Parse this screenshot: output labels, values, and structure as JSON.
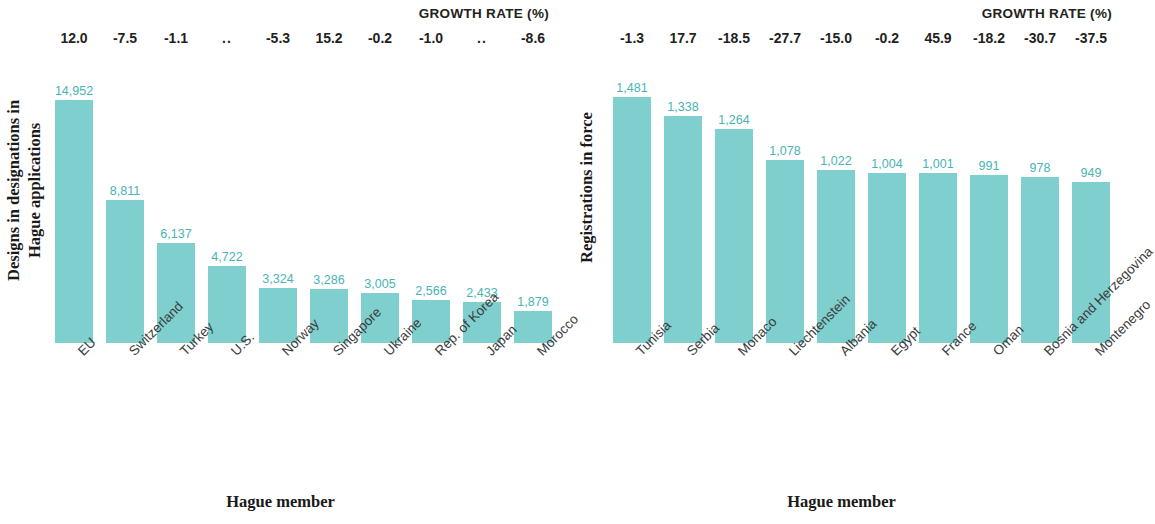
{
  "theme": {
    "bar_color": "#7ecfcd",
    "value_label_color": "#49b3b4",
    "text_color": "#231f20"
  },
  "panels": {
    "left": {
      "growth_header": "GROWTH RATE (%)",
      "y_title": "Designs in designations in\nHague applications",
      "x_title": "Hague member"
    },
    "right": {
      "growth_header": "GROWTH RATE (%)",
      "y_title": "Registrations in force",
      "x_title": "Hague member"
    }
  },
  "chart_data": [
    {
      "type": "bar",
      "title": "Designs in designations in Hague applications",
      "xlabel": "Hague member",
      "ylabel": "Designs in designations in Hague applications",
      "categories": [
        "EU",
        "Switzerland",
        "Turkey",
        "U.S.",
        "Norway",
        "Singapore",
        "Ukraine",
        "Rep. of Korea",
        "Japan",
        "Morocco"
      ],
      "values": [
        14952,
        8811,
        6137,
        4722,
        3324,
        3286,
        3005,
        2566,
        2433,
        1879
      ],
      "value_labels": [
        "14,952",
        "8,811",
        "6,137",
        "4,722",
        "3,324",
        "3,286",
        "3,005",
        "2,566",
        "2,433",
        "1,879"
      ],
      "growth_rate_label": "GROWTH RATE (%)",
      "growth_rates": [
        "12.0",
        "-7.5",
        "-1.1",
        "..",
        "-5.3",
        "15.2",
        "-0.2",
        "-1.0",
        "..",
        "-8.6"
      ],
      "bar_pixel_heights": [
        243,
        143,
        100,
        77,
        55,
        54,
        50,
        43,
        41,
        32
      ],
      "grid": false,
      "legend": false
    },
    {
      "type": "bar",
      "title": "Registrations in force",
      "xlabel": "Hague member",
      "ylabel": "Registrations in force",
      "categories": [
        "Tunisia",
        "Serbia",
        "Monaco",
        "Liechtenstein",
        "Albania",
        "Egypt",
        "France",
        "Oman",
        "Bosnia and Herzegovina",
        "Montenegro"
      ],
      "values": [
        1481,
        1338,
        1264,
        1078,
        1022,
        1004,
        1001,
        991,
        978,
        949
      ],
      "value_labels": [
        "1,481",
        "1,338",
        "1,264",
        "1,078",
        "1,022",
        "1,004",
        "1,001",
        "991",
        "978",
        "949"
      ],
      "growth_rate_label": "GROWTH RATE (%)",
      "growth_rates": [
        "-1.3",
        "17.7",
        "-18.5",
        "-27.7",
        "-15.0",
        "-0.2",
        "45.9",
        "-18.2",
        "-30.7",
        "-37.5"
      ],
      "bar_pixel_heights": [
        246,
        227,
        214,
        183,
        173,
        170,
        170,
        168,
        166,
        161
      ],
      "grid": false,
      "legend": false
    }
  ]
}
